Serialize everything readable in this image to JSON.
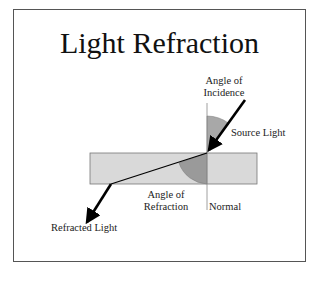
{
  "slide": {
    "title": "Light Refraction"
  },
  "labels": {
    "angle_of_incidence_line1": "Angle of",
    "angle_of_incidence_line2": "Incidence",
    "source_light": "Source Light",
    "angle_of_refraction_line1": "Angle of",
    "angle_of_refraction_line2": "Refraction",
    "normal": "Normal",
    "refracted_light": "Refracted Light"
  },
  "colors": {
    "frame_border": "#555555",
    "glass_fill": "#d9d9d9",
    "glass_border": "#777777",
    "incidence_arc": "#a8a8a8",
    "refraction_arc": "#9a9a9a",
    "ray": "#000000",
    "normal_line": "#888888"
  }
}
